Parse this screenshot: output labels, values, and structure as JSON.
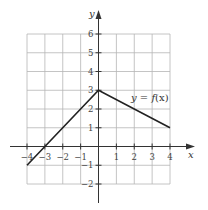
{
  "chart_data": {
    "type": "line",
    "title": "",
    "xlabel": "x",
    "ylabel": "y",
    "xlim": [
      -4,
      4
    ],
    "ylim": [
      -2,
      6
    ],
    "grid": true,
    "x_ticks": [
      -4,
      -3,
      -2,
      -1,
      1,
      2,
      3,
      4
    ],
    "y_ticks": [
      -2,
      -1,
      1,
      2,
      3,
      4,
      5,
      6
    ],
    "x_tick_labels": [
      "−4",
      "−3",
      "−2",
      "−1",
      "1",
      "2",
      "3",
      "4"
    ],
    "y_tick_labels": [
      "−2",
      "−1",
      "1",
      "2",
      "3",
      "4",
      "5",
      "6"
    ],
    "series": [
      {
        "name": "y = f(x)",
        "points": [
          [
            -4,
            -1
          ],
          [
            0,
            3
          ],
          [
            4,
            1
          ]
        ]
      }
    ],
    "annotations": [
      {
        "text": "y = f(x)",
        "x": 2.4,
        "y": 2.5
      }
    ],
    "legend": "none"
  },
  "labels": {
    "x_axis": "x",
    "y_axis": "y",
    "function_label_y": "y",
    "function_label_eq": " = ",
    "function_label_f": "f",
    "function_label_arg": "(x)"
  }
}
